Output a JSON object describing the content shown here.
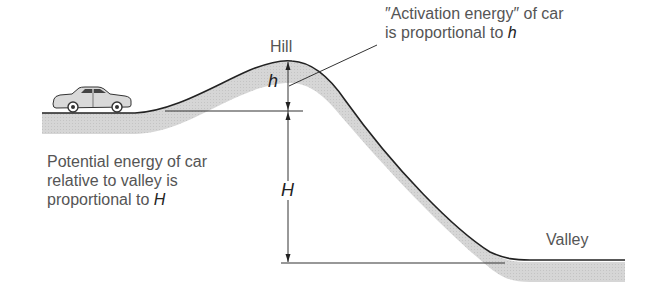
{
  "diagram": {
    "type": "energy landscape analogy",
    "labels": {
      "hill": "Hill",
      "valley": "Valley",
      "activation_line1": "″Activation energy″ of car",
      "activation_line2_prefix": "is proportional to ",
      "activation_var": "h",
      "potential_line1": "Potential energy of car",
      "potential_line2": "relative to valley is",
      "potential_line3_prefix": "proportional to ",
      "potential_var": "H",
      "small_h": "h",
      "big_H": "H"
    },
    "colors": {
      "line": "#222222",
      "shading": "#d4d4d4",
      "text": "#555555"
    },
    "objects": [
      "car",
      "hill",
      "valley",
      "dimension-arrow-h",
      "dimension-arrow-H"
    ]
  }
}
